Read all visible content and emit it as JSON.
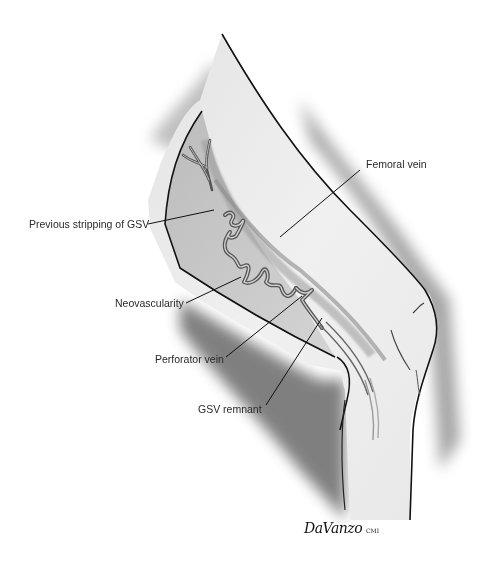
{
  "figure": {
    "labels": [
      {
        "id": "femoral-vein",
        "text": "Femoral vein"
      },
      {
        "id": "previous-stripping",
        "text": "Previous stripping of GSV"
      },
      {
        "id": "neovascularity",
        "text": "Neovascularity"
      },
      {
        "id": "perforator-vein",
        "text": "Perforator vein"
      },
      {
        "id": "gsv-remnant",
        "text": "GSV remnant"
      }
    ],
    "signature": {
      "name": "DaVanzo",
      "suffix": "CMI"
    }
  }
}
